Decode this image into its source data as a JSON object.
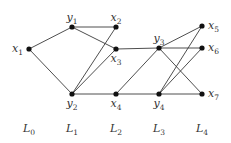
{
  "diagram": {
    "type": "layered-graph",
    "nodes": [
      {
        "id": "x1",
        "base": "x",
        "sub": "1",
        "level": "L0",
        "x": 29,
        "y": 49,
        "label_pos": "left"
      },
      {
        "id": "y1",
        "base": "y",
        "sub": "1",
        "level": "L1",
        "x": 72,
        "y": 27,
        "label_pos": "top"
      },
      {
        "id": "y2",
        "base": "y",
        "sub": "2",
        "level": "L1",
        "x": 72,
        "y": 94,
        "label_pos": "bottom"
      },
      {
        "id": "x2",
        "base": "x",
        "sub": "2",
        "level": "L2",
        "x": 116,
        "y": 27,
        "label_pos": "top"
      },
      {
        "id": "x3",
        "base": "x",
        "sub": "3",
        "level": "L2",
        "x": 116,
        "y": 49,
        "label_pos": "bottom"
      },
      {
        "id": "x4",
        "base": "x",
        "sub": "4",
        "level": "L2",
        "x": 116,
        "y": 94,
        "label_pos": "bottom"
      },
      {
        "id": "y3",
        "base": "y",
        "sub": "3",
        "level": "L3",
        "x": 159,
        "y": 48,
        "label_pos": "top"
      },
      {
        "id": "y4",
        "base": "y",
        "sub": "4",
        "level": "L3",
        "x": 159,
        "y": 94,
        "label_pos": "bottom"
      },
      {
        "id": "x5",
        "base": "x",
        "sub": "5",
        "level": "L4",
        "x": 202,
        "y": 26,
        "label_pos": "right"
      },
      {
        "id": "x6",
        "base": "x",
        "sub": "6",
        "level": "L4",
        "x": 202,
        "y": 48,
        "label_pos": "right"
      },
      {
        "id": "x7",
        "base": "x",
        "sub": "7",
        "level": "L4",
        "x": 202,
        "y": 94,
        "label_pos": "right"
      }
    ],
    "edges": [
      [
        "x1",
        "y1"
      ],
      [
        "x1",
        "y2"
      ],
      [
        "y1",
        "x2"
      ],
      [
        "y1",
        "x3"
      ],
      [
        "y2",
        "x2"
      ],
      [
        "y2",
        "x3"
      ],
      [
        "y2",
        "x4"
      ],
      [
        "x3",
        "y3"
      ],
      [
        "x4",
        "y3"
      ],
      [
        "x4",
        "y4"
      ],
      [
        "y3",
        "x5"
      ],
      [
        "y3",
        "x6"
      ],
      [
        "y3",
        "x7"
      ],
      [
        "y4",
        "x5"
      ],
      [
        "y4",
        "x6"
      ],
      [
        "y4",
        "x7"
      ]
    ],
    "levels": [
      {
        "base": "L",
        "sub": "0",
        "x": 29
      },
      {
        "base": "L",
        "sub": "1",
        "x": 72
      },
      {
        "base": "L",
        "sub": "2",
        "x": 116
      },
      {
        "base": "L",
        "sub": "3",
        "x": 159
      },
      {
        "base": "L",
        "sub": "4",
        "x": 202
      }
    ],
    "level_label_y": 132,
    "colors": {
      "edge": "#3a3a3a",
      "node": "#111111",
      "label": "#333333"
    }
  }
}
